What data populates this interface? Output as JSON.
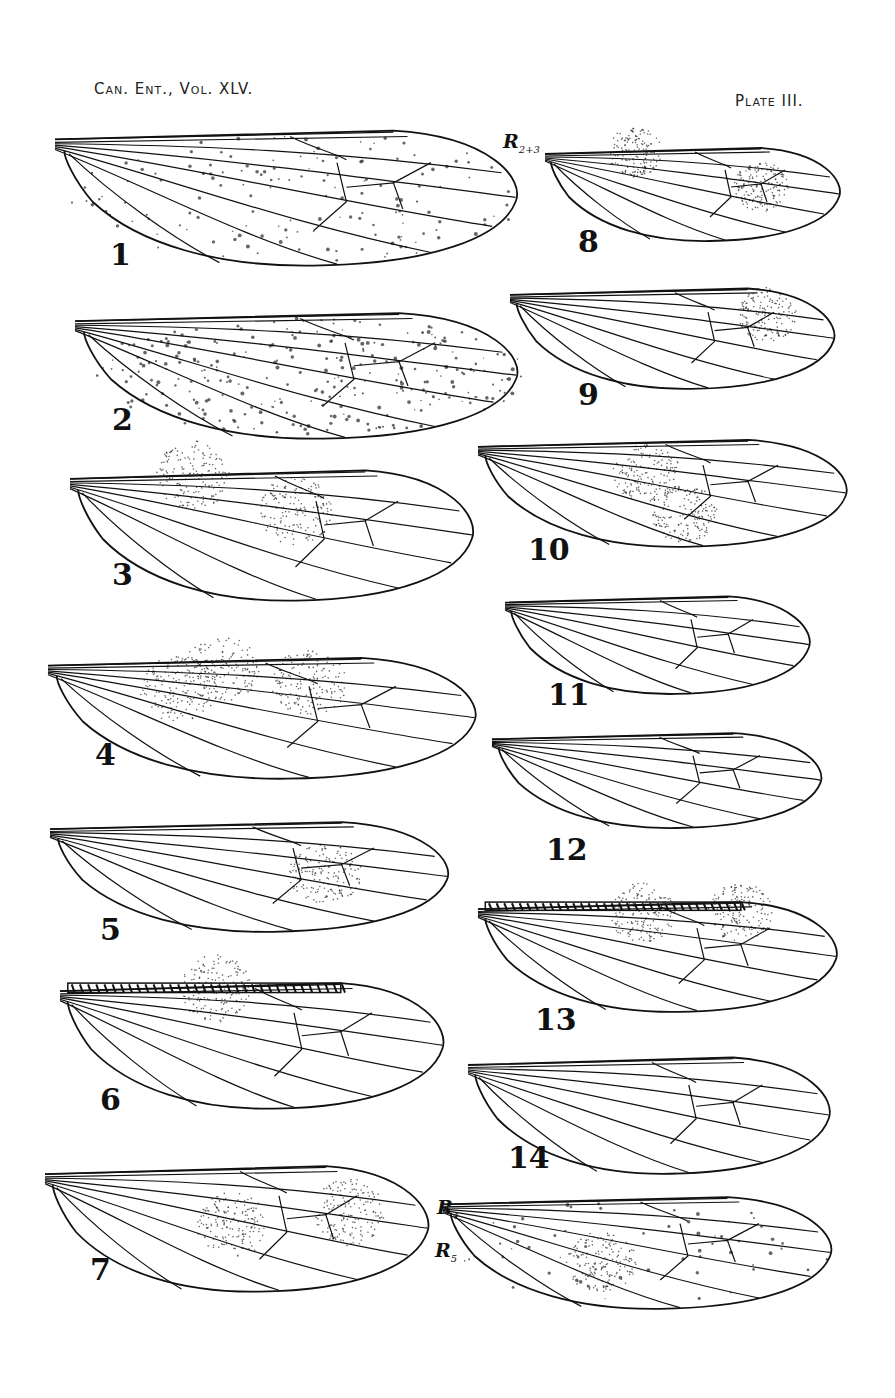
{
  "header": {
    "journal": "Can. Ent., Vol. XLV.",
    "plate": "Plate III."
  },
  "vein_labels": [
    {
      "id": "r23",
      "text": "R",
      "sub": "2+3",
      "x": 503,
      "y": 142
    },
    {
      "id": "r4",
      "text": "R",
      "sub": "4",
      "x": 437,
      "y": 1208
    },
    {
      "id": "r5",
      "text": "R",
      "sub": "5",
      "x": 435,
      "y": 1251
    }
  ],
  "figures": [
    {
      "label": "1",
      "x": 55,
      "y": 122,
      "w": 470,
      "h": 145,
      "numX": 110,
      "numY": 245,
      "stipple": "spots",
      "shade": []
    },
    {
      "label": "2",
      "x": 75,
      "y": 305,
      "w": 450,
      "h": 135,
      "numX": 112,
      "numY": 410,
      "stipple": "dense-spots",
      "shade": []
    },
    {
      "label": "3",
      "x": 70,
      "y": 462,
      "w": 410,
      "h": 140,
      "numX": 112,
      "numY": 565,
      "stipple": "none",
      "shade": [
        [
          0.55,
          0.35
        ],
        [
          0.3,
          0.1
        ]
      ]
    },
    {
      "label": "4",
      "x": 48,
      "y": 650,
      "w": 435,
      "h": 130,
      "numX": 95,
      "numY": 745,
      "stipple": "none",
      "shade": [
        [
          0.6,
          0.25
        ],
        [
          0.4,
          0.15
        ],
        [
          0.3,
          0.3
        ]
      ]
    },
    {
      "label": "5",
      "x": 50,
      "y": 815,
      "w": 405,
      "h": 118,
      "numX": 100,
      "numY": 920,
      "stipple": "none",
      "shade": [
        [
          0.68,
          0.5
        ]
      ]
    },
    {
      "label": "6",
      "x": 60,
      "y": 975,
      "w": 390,
      "h": 135,
      "numX": 100,
      "numY": 1090,
      "stipple": "banded",
      "shade": [
        [
          0.4,
          0.1
        ]
      ]
    },
    {
      "label": "7",
      "x": 45,
      "y": 1158,
      "w": 390,
      "h": 135,
      "numX": 90,
      "numY": 1260,
      "stipple": "none",
      "shade": [
        [
          0.48,
          0.5
        ],
        [
          0.78,
          0.4
        ]
      ]
    },
    {
      "label": "8",
      "x": 545,
      "y": 142,
      "w": 300,
      "h": 100,
      "numX": 578,
      "numY": 232,
      "stipple": "none",
      "shade": [
        [
          0.72,
          0.45
        ],
        [
          0.3,
          0.1
        ]
      ]
    },
    {
      "label": "9",
      "x": 510,
      "y": 282,
      "w": 330,
      "h": 108,
      "numX": 578,
      "numY": 385,
      "stipple": "none",
      "shade": [
        [
          0.78,
          0.3
        ]
      ]
    },
    {
      "label": "10",
      "x": 478,
      "y": 433,
      "w": 375,
      "h": 115,
      "numX": 528,
      "numY": 540,
      "stipple": "none",
      "shade": [
        [
          0.45,
          0.35
        ],
        [
          0.55,
          0.7
        ]
      ]
    },
    {
      "label": "11",
      "x": 505,
      "y": 590,
      "w": 310,
      "h": 105,
      "numX": 548,
      "numY": 685,
      "stipple": "none",
      "shade": []
    },
    {
      "label": "12",
      "x": 492,
      "y": 727,
      "w": 335,
      "h": 102,
      "numX": 546,
      "numY": 840,
      "stipple": "none",
      "shade": []
    },
    {
      "label": "13",
      "x": 478,
      "y": 895,
      "w": 365,
      "h": 118,
      "numX": 535,
      "numY": 1010,
      "stipple": "barred",
      "shade": [
        [
          0.45,
          0.15
        ],
        [
          0.72,
          0.15
        ]
      ]
    },
    {
      "label": "14",
      "x": 468,
      "y": 1050,
      "w": 368,
      "h": 125,
      "numX": 508,
      "numY": 1148,
      "stipple": "none",
      "shade": []
    },
    {
      "label": "",
      "x": 443,
      "y": 1190,
      "w": 395,
      "h": 120,
      "numX": 0,
      "numY": 0,
      "stipple": "light",
      "shade": [
        [
          0.4,
          0.6
        ]
      ]
    }
  ]
}
